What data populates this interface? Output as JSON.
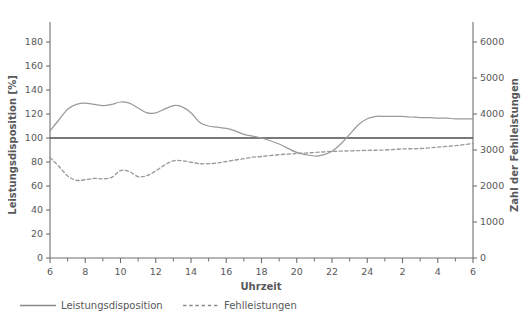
{
  "chart_data": {
    "type": "line",
    "title": "",
    "subtitle": "",
    "xlabel": "Uhrzeit",
    "ylabel": "Leistungsdisposition [%]",
    "y2label": "Zahl der Fehlleistungen",
    "xlim": [
      6,
      30
    ],
    "ylim": [
      0,
      190
    ],
    "y2lim": [
      0,
      6333
    ],
    "grid": false,
    "legend_position": "bottom-left",
    "x_tick_labels": [
      "6",
      "8",
      "10",
      "12",
      "14",
      "16",
      "18",
      "20",
      "22",
      "24",
      "2",
      "4",
      "6"
    ],
    "x_tick_values": [
      6,
      8,
      10,
      12,
      14,
      16,
      18,
      20,
      22,
      24,
      26,
      28,
      30
    ],
    "x_minor_tick_values": [
      7,
      9,
      11,
      13,
      15,
      17,
      19,
      21,
      23,
      25,
      27,
      29
    ],
    "y_tick_labels": [
      "0",
      "20",
      "40",
      "60",
      "80",
      "100",
      "120",
      "140",
      "160",
      "180"
    ],
    "y_tick_values": [
      0,
      20,
      40,
      60,
      80,
      100,
      120,
      140,
      160,
      180
    ],
    "y2_tick_labels": [
      "0",
      "1000",
      "2000",
      "3000",
      "4000",
      "5000",
      "6000"
    ],
    "y2_tick_values": [
      0,
      1000,
      2000,
      3000,
      4000,
      5000,
      6000
    ],
    "reference_line": {
      "y_left": 100,
      "y_right": 3000,
      "label": ""
    },
    "series": [
      {
        "name": "Leistungsdisposition",
        "style": "solid",
        "color": "#9a9a9c",
        "axis": "left",
        "unit": "%",
        "x": [
          6,
          6.5,
          7,
          7.5,
          8,
          8.5,
          9,
          9.5,
          10,
          10.5,
          11,
          11.5,
          12,
          12.5,
          13,
          13.5,
          14,
          14.5,
          15,
          15.5,
          16,
          16.5,
          17,
          18,
          19,
          20,
          21,
          21.5,
          22,
          22.5,
          23,
          23.5,
          24,
          24.5,
          25,
          25.5,
          26,
          26.5,
          27,
          27.5,
          28,
          28.5,
          29,
          29.5,
          30
        ],
        "values": [
          106,
          115,
          124,
          128,
          129,
          128,
          127,
          128,
          130,
          129,
          125,
          121,
          121,
          124,
          127,
          126,
          121,
          113,
          110,
          109,
          108,
          106,
          103,
          100,
          95,
          88,
          85,
          86,
          89,
          95,
          103,
          111,
          116,
          118,
          118,
          118,
          118,
          117.5,
          117,
          117,
          116.5,
          116.5,
          116,
          116,
          116
        ]
      },
      {
        "name": "Fehlleistungen",
        "style": "dashed",
        "color": "#9a9a9c",
        "axis": "right",
        "unit": "",
        "x": [
          6,
          6.5,
          7,
          7.5,
          8,
          8.5,
          9,
          9.5,
          10,
          10.5,
          11,
          11.5,
          12,
          12.5,
          13,
          13.5,
          14,
          14.5,
          15,
          15.5,
          16,
          16.5,
          17,
          17.5,
          18,
          19,
          20,
          21,
          22,
          23,
          24,
          25,
          26,
          27,
          28,
          29,
          30
        ],
        "values": [
          2790,
          2550,
          2280,
          2160,
          2175,
          2210,
          2200,
          2240,
          2430,
          2400,
          2260,
          2290,
          2420,
          2580,
          2700,
          2700,
          2660,
          2620,
          2620,
          2640,
          2680,
          2720,
          2760,
          2800,
          2820,
          2870,
          2900,
          2930,
          2960,
          2975,
          2990,
          3000,
          3030,
          3040,
          3080,
          3120,
          3180
        ]
      }
    ],
    "annotations": [
      {
        "text": "Leistungsmaximum",
        "x": 10,
        "value": 130,
        "series": "Leistungsdisposition",
        "rendered": false
      },
      {
        "text": "Nachmittagstief",
        "x": 21,
        "value": 85,
        "series": "Leistungsdisposition",
        "rendered": false
      },
      {
        "text": "Nachtminimum",
        "x": 27,
        "value": 40,
        "series": "Leistungsdisposition",
        "rendered": false
      },
      {
        "text": "Fehlerspitze",
        "x": 27,
        "value": 5450,
        "series": "Fehlleistungen",
        "rendered": false
      }
    ]
  },
  "legend": {
    "items": [
      {
        "label": "Leistungsdisposition",
        "style": "solid"
      },
      {
        "label": "Fehlleistungen",
        "style": "dashed"
      }
    ]
  },
  "axes": {
    "left_title": "Leistungsdisposition [%]",
    "right_title": "Zahl der Fehlleistungen",
    "bottom_title": "Uhrzeit"
  }
}
